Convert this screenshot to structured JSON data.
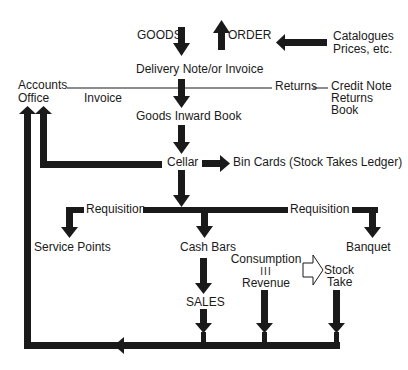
{
  "diagram": {
    "type": "flowchart",
    "colors": {
      "ink": "#1a1a1a",
      "background": "#ffffff"
    },
    "nodes": {
      "goods": "GOODS",
      "order": "ORDER",
      "catalogues_line1": "Catalogues",
      "catalogues_line2": "Prices, etc.",
      "delivery_note": "Delivery Note/or Invoice",
      "accounts_line1": "Accounts",
      "accounts_line2": "Office",
      "invoice": "Invoice",
      "returns": "Returns",
      "credit_line1": "Credit Note",
      "credit_line2": "Returns",
      "credit_line3": "Book",
      "goods_inward_book": "Goods Inward Book",
      "cellar": "Cellar",
      "bin_cards": "Bin Cards (Stock Takes Ledger)",
      "requisition_left": "Requisition",
      "requisition_right": "Requisition",
      "service_points": "Service Points",
      "cash_bars": "Cash Bars",
      "banquet": "Banquet",
      "sales": "SALES",
      "consumption": "Consumption",
      "equals_symbol": "III",
      "revenue": "Revenue",
      "stock_line1": "Stock",
      "stock_line2": "Take"
    },
    "edges": [
      {
        "from": "GOODS",
        "to": "Delivery Note/or Invoice"
      },
      {
        "from": "Catalogues Prices, etc.",
        "to": "ORDER"
      },
      {
        "from": "Delivery Note/or Invoice",
        "to": "Goods Inward Book"
      },
      {
        "from": "Delivery Note/or Invoice",
        "to": "Accounts Office",
        "label": "Invoice"
      },
      {
        "from": "Delivery Note/or Invoice",
        "to": "Credit Note Returns Book",
        "label": "Returns"
      },
      {
        "from": "Goods Inward Book",
        "to": "Cellar"
      },
      {
        "from": "Cellar",
        "to": "Accounts Office"
      },
      {
        "from": "Cellar",
        "to": "Bin Cards (Stock Takes Ledger)"
      },
      {
        "from": "Cellar",
        "to": "Service Points",
        "label": "Requisition"
      },
      {
        "from": "Cellar",
        "to": "Cash Bars"
      },
      {
        "from": "Cellar",
        "to": "Banquet",
        "label": "Requisition"
      },
      {
        "from": "Cash Bars",
        "to": "SALES"
      },
      {
        "from": "Consumption = Revenue",
        "to": "Stock Take"
      },
      {
        "from": "SALES",
        "to": "Accounts Office"
      },
      {
        "from": "Consumption = Revenue",
        "to": "Accounts Office"
      },
      {
        "from": "Stock Take",
        "to": "Accounts Office"
      }
    ]
  }
}
